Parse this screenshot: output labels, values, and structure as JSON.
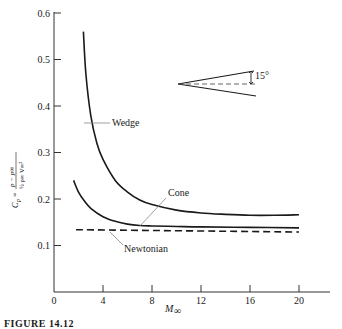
{
  "chart_data": {
    "type": "line",
    "title": "",
    "xlabel": "M∞",
    "ylabel": "Cp = (p − p∞) / (½ ρ∞ V∞²)",
    "xlim": [
      0,
      22
    ],
    "ylim": [
      0,
      0.6
    ],
    "x_ticks": [
      0,
      4,
      8,
      12,
      16,
      20
    ],
    "y_ticks": [
      0.1,
      0.2,
      0.3,
      0.4,
      0.5,
      0.6
    ],
    "x_tick_labels": [
      "0",
      "4",
      "8",
      "12",
      "16",
      "20"
    ],
    "y_tick_labels": [
      "0.1",
      "0.2",
      "0.3",
      "0.4",
      "0.5",
      "0.6"
    ],
    "grid": false,
    "series": [
      {
        "name": "Wedge",
        "style": "solid",
        "x": [
          2.4,
          2.6,
          3.0,
          3.5,
          4.0,
          5.0,
          6.0,
          7.0,
          8.0,
          10.0,
          12.0,
          14.0,
          16.0,
          18.0,
          20.0
        ],
        "y": [
          0.56,
          0.47,
          0.38,
          0.32,
          0.285,
          0.24,
          0.215,
          0.198,
          0.188,
          0.176,
          0.17,
          0.167,
          0.165,
          0.165,
          0.166
        ]
      },
      {
        "name": "Cone",
        "style": "solid",
        "x": [
          1.6,
          2.0,
          2.5,
          3.0,
          4.0,
          5.0,
          6.0,
          7.0,
          8.0,
          10.0,
          12.0,
          16.0,
          20.0
        ],
        "y": [
          0.24,
          0.215,
          0.195,
          0.18,
          0.162,
          0.152,
          0.146,
          0.143,
          0.142,
          0.141,
          0.14,
          0.139,
          0.138
        ]
      },
      {
        "name": "Newtonian",
        "style": "dashed",
        "x": [
          1.8,
          20.0
        ],
        "y": [
          0.134,
          0.129
        ]
      }
    ],
    "annotations": [
      {
        "text": "Wedge",
        "x": 8.0,
        "y": 0.36
      },
      {
        "text": "Cone",
        "x": 9.0,
        "y": 0.2
      },
      {
        "text": "Newtonian",
        "x": 7.8,
        "y": 0.095
      }
    ],
    "inset": {
      "description": "Body half-angle sketch",
      "angle_label": "15°"
    }
  },
  "labels": {
    "wedge": "Wedge",
    "cone": "Cone",
    "newtonian": "Newtonian",
    "angle": "15°",
    "x_axis": "M",
    "x_axis_sub": "∞",
    "y_axis": "Cp = (p − p∞)/(½ ρ∞ V∞²)",
    "caption": "FIGURE 14.12"
  }
}
